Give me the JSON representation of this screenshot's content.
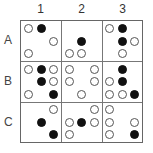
{
  "column_labels": [
    "1",
    "2",
    "3"
  ],
  "row_labels": [
    "A",
    "B",
    "C"
  ],
  "legend": {
    "open": "open circle",
    "filled": "filled circle"
  },
  "cells": {
    "A1": [
      [
        "open",
        "filled",
        ""
      ],
      [
        "",
        "",
        "open"
      ],
      [
        "open",
        "",
        ""
      ]
    ],
    "A2": [
      [
        "",
        "",
        ""
      ],
      [
        "",
        "filled",
        ""
      ],
      [
        "open",
        "open",
        ""
      ]
    ],
    "A3": [
      [
        "open",
        "filled",
        ""
      ],
      [
        "",
        "filled",
        "open"
      ],
      [
        "",
        "open",
        ""
      ]
    ],
    "B1": [
      [
        "open",
        "filled",
        "open"
      ],
      [
        "",
        "filled",
        "open"
      ],
      [
        "open",
        "",
        "filled"
      ]
    ],
    "B2": [
      [
        "open",
        "",
        "open"
      ],
      [
        "open",
        "",
        "open"
      ],
      [
        "",
        "open",
        ""
      ]
    ],
    "B3": [
      [
        "",
        "filled",
        ""
      ],
      [
        "open",
        "filled",
        ""
      ],
      [
        "open",
        "open",
        "filled"
      ]
    ],
    "C1": [
      [
        "",
        "",
        "open"
      ],
      [
        "",
        "filled",
        ""
      ],
      [
        "",
        "",
        "filled"
      ]
    ],
    "C2": [
      [
        "",
        "",
        "open"
      ],
      [
        "open",
        "filled",
        "open"
      ],
      [
        "open",
        "",
        ""
      ]
    ],
    "C3": [
      [
        "open",
        "",
        ""
      ],
      [
        "open",
        "",
        "open"
      ],
      [
        "open",
        "",
        "filled"
      ]
    ]
  }
}
